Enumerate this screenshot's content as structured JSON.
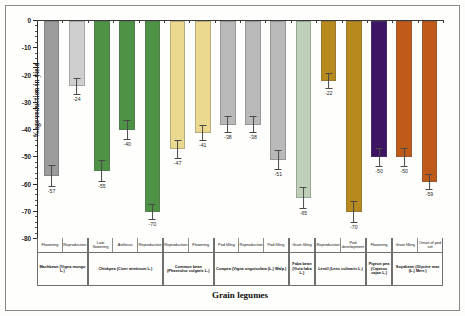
{
  "chart_data": {
    "type": "bar",
    "title": "",
    "xlabel": "Grain legumes",
    "ylabel": "%age reduction in yield",
    "ylim": [
      -80,
      0
    ],
    "ytick_step": 10,
    "yticks": [
      0,
      -10,
      -20,
      -30,
      -40,
      -50,
      -60,
      -70,
      -80
    ],
    "ytick_labels": [
      "0",
      "-10",
      "-20",
      "-30",
      "-40",
      "-50",
      "-60",
      "-70",
      "-80"
    ],
    "grid": false,
    "legend": false,
    "orientation": "vertical-downward",
    "categories": [
      "Flowering",
      "Reproduction",
      "Late flowering",
      "Anthesis",
      "Reproduction",
      "Reproduction",
      "Flowering",
      "Pod filling",
      "Reproduction",
      "Pod filling",
      "Grain filling",
      "Reproduction",
      "Pod development",
      "Flowering",
      "Grain filling",
      "Onset of pod set"
    ],
    "values": [
      -57,
      -24,
      -55,
      -40,
      -70,
      -47,
      -41,
      -38,
      -38,
      -51,
      -65,
      -22,
      -70,
      -50,
      -50,
      -59
    ],
    "errors": [
      4,
      3,
      4,
      3.5,
      3,
      3.5,
      3,
      3,
      3,
      3.5,
      4,
      3,
      4,
      3.5,
      3.5,
      3
    ],
    "value_labels": [
      "-57",
      "-24",
      "-55",
      "-40",
      "-70",
      "-47",
      "-41",
      "-38",
      "-38",
      "-51",
      "-65",
      "-22",
      "-70",
      "-50",
      "-50",
      "-59"
    ],
    "colors": [
      "#9c9c9c",
      "#cfcfcf",
      "#4e9245",
      "#4e9245",
      "#4e9245",
      "#ead98f",
      "#ead98f",
      "#b9b9b9",
      "#b9b9b9",
      "#b9b9b9",
      "#bed0ba",
      "#b88a1e",
      "#b88a1e",
      "#3d1464",
      "#c05a19",
      "#c05a19"
    ],
    "species_groups": [
      {
        "name": "Mashbean (Vigna mungo L.)",
        "stages": [
          "Flowering",
          "Reproduction"
        ]
      },
      {
        "name": "Chickpea (Cicer arietinum L.)",
        "stages": [
          "Late flowering",
          "Anthesis",
          "Reproduction"
        ]
      },
      {
        "name": "Common bean (Phaseolus vulgaris L.)",
        "stages": [
          "Reproduction",
          "Flowering"
        ]
      },
      {
        "name": "Cowpea (Vigna unguiculata (L.) Walp.)",
        "stages": [
          "Pod filling",
          "Reproduction",
          "Pod filling"
        ]
      },
      {
        "name": "Faba bean (Vicia faba L.)",
        "stages": [
          "Grain filling"
        ]
      },
      {
        "name": "Lentil (Lens culinaris L.)",
        "stages": [
          "Reproduction",
          "Pod development"
        ]
      },
      {
        "name": "Pigeon pea (Cajanus cajan L.)",
        "stages": [
          "Flowering"
        ]
      },
      {
        "name": "Soyabean (Glycine max (L.) Merr.)",
        "stages": [
          "Grain filling",
          "Onset of pod set"
        ]
      }
    ]
  }
}
